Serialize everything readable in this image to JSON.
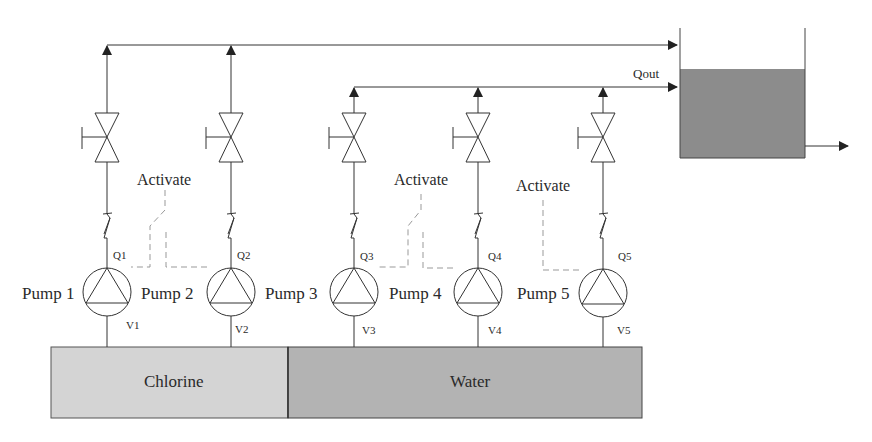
{
  "diagram": {
    "type": "process-flow",
    "output_flow_label": "Qout",
    "activate_labels": [
      "Activate",
      "Activate",
      "Activate"
    ],
    "pumps": [
      {
        "label": "Pump 1",
        "flow": "Q1",
        "valve": "V1",
        "source": "Chlorine"
      },
      {
        "label": "Pump 2",
        "flow": "Q2",
        "valve": "V2",
        "source": "Chlorine"
      },
      {
        "label": "Pump 3",
        "flow": "Q3",
        "valve": "V3",
        "source": "Water"
      },
      {
        "label": "Pump 4",
        "flow": "Q4",
        "valve": "V4",
        "source": "Water"
      },
      {
        "label": "Pump 5",
        "flow": "Q5",
        "valve": "V5",
        "source": "Water"
      }
    ],
    "source_tanks": [
      {
        "label": "Chlorine",
        "color": "#d4d4d4"
      },
      {
        "label": "Water",
        "color": "#b3b3b3"
      }
    ],
    "product_tank": {
      "liquid_color": "#8c8c8c"
    },
    "line_color": "#333333"
  }
}
